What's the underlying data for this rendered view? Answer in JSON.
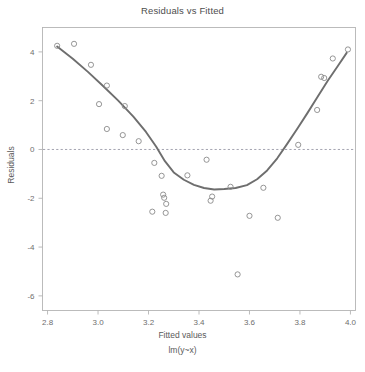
{
  "chart_data": {
    "type": "scatter",
    "title": "Residuals vs Fitted",
    "xlabel": "Fitted values",
    "sublabel": "lm(y~x)",
    "ylabel": "Residuals",
    "xlim": [
      2.78,
      4.02
    ],
    "ylim": [
      -6.6,
      5.0
    ],
    "xticks": [
      "2.8",
      "3.0",
      "3.2",
      "3.4",
      "3.6",
      "3.8",
      "4.0"
    ],
    "xtick_values": [
      2.8,
      3.0,
      3.2,
      3.4,
      3.6,
      3.8,
      4.0
    ],
    "yticks": [
      "4",
      "2",
      "0",
      "-2",
      "-4",
      "-6"
    ],
    "ytick_values": [
      4,
      2,
      0,
      -2,
      -4,
      -6
    ],
    "grid": false,
    "legend": null,
    "zero_reference_line": 0,
    "point_marker": "open-circle",
    "point_color": "#8a8a8a",
    "line_color": "#6e6e6e",
    "reference_line_color": "#9a9aa8",
    "box_color": "#b4b4b4",
    "points": [
      {
        "x": 2.838,
        "y": 4.25
      },
      {
        "x": 2.905,
        "y": 4.33
      },
      {
        "x": 2.972,
        "y": 3.47
      },
      {
        "x": 3.035,
        "y": 2.62
      },
      {
        "x": 3.004,
        "y": 1.86
      },
      {
        "x": 3.106,
        "y": 1.78
      },
      {
        "x": 3.035,
        "y": 0.84
      },
      {
        "x": 3.098,
        "y": 0.59
      },
      {
        "x": 3.161,
        "y": 0.34
      },
      {
        "x": 3.223,
        "y": -0.55
      },
      {
        "x": 3.252,
        "y": -1.08
      },
      {
        "x": 3.258,
        "y": -1.85
      },
      {
        "x": 3.262,
        "y": -1.98
      },
      {
        "x": 3.27,
        "y": -2.23
      },
      {
        "x": 3.215,
        "y": -2.55
      },
      {
        "x": 3.268,
        "y": -2.6
      },
      {
        "x": 3.354,
        "y": -1.06
      },
      {
        "x": 3.43,
        "y": -0.42
      },
      {
        "x": 3.525,
        "y": -1.53
      },
      {
        "x": 3.452,
        "y": -1.93
      },
      {
        "x": 3.446,
        "y": -2.1
      },
      {
        "x": 3.553,
        "y": -5.12
      },
      {
        "x": 3.6,
        "y": -2.72
      },
      {
        "x": 3.655,
        "y": -1.57
      },
      {
        "x": 3.712,
        "y": -2.8
      },
      {
        "x": 3.793,
        "y": 0.19
      },
      {
        "x": 3.868,
        "y": 1.62
      },
      {
        "x": 3.884,
        "y": 2.98
      },
      {
        "x": 3.896,
        "y": 2.93
      },
      {
        "x": 3.93,
        "y": 3.73
      },
      {
        "x": 3.99,
        "y": 4.1
      }
    ],
    "smoother": [
      {
        "x": 2.838,
        "y": 4.22
      },
      {
        "x": 2.9,
        "y": 3.72
      },
      {
        "x": 2.96,
        "y": 3.18
      },
      {
        "x": 3.02,
        "y": 2.6
      },
      {
        "x": 3.08,
        "y": 2.0
      },
      {
        "x": 3.14,
        "y": 1.35
      },
      {
        "x": 3.19,
        "y": 0.72
      },
      {
        "x": 3.23,
        "y": 0.12
      },
      {
        "x": 3.265,
        "y": -0.48
      },
      {
        "x": 3.3,
        "y": -0.94
      },
      {
        "x": 3.34,
        "y": -1.24
      },
      {
        "x": 3.38,
        "y": -1.45
      },
      {
        "x": 3.42,
        "y": -1.58
      },
      {
        "x": 3.46,
        "y": -1.64
      },
      {
        "x": 3.5,
        "y": -1.62
      },
      {
        "x": 3.545,
        "y": -1.58
      },
      {
        "x": 3.59,
        "y": -1.46
      },
      {
        "x": 3.63,
        "y": -1.22
      },
      {
        "x": 3.67,
        "y": -0.86
      },
      {
        "x": 3.71,
        "y": -0.36
      },
      {
        "x": 3.75,
        "y": 0.24
      },
      {
        "x": 3.79,
        "y": 0.86
      },
      {
        "x": 3.83,
        "y": 1.5
      },
      {
        "x": 3.87,
        "y": 2.16
      },
      {
        "x": 3.91,
        "y": 2.82
      },
      {
        "x": 3.95,
        "y": 3.42
      },
      {
        "x": 3.985,
        "y": 3.96
      }
    ]
  }
}
